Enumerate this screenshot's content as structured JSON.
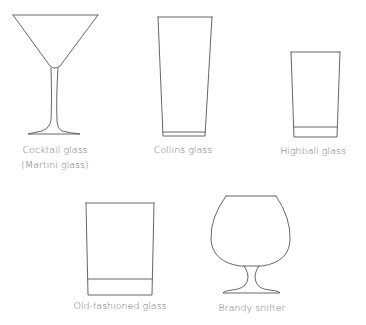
{
  "glasses": [
    {
      "name": "Cocktail glass",
      "subname": "(Martini glass)"
    },
    {
      "name": "Collins glass"
    },
    {
      "name": "Highball glass"
    },
    {
      "name": "Old-fashioned glass"
    },
    {
      "name": "Brandy snifter"
    }
  ],
  "colors": {
    "line": "#555555",
    "text": "#6f6f6f",
    "background": "#ffffff"
  }
}
